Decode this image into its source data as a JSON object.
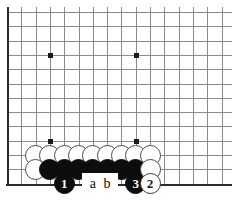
{
  "diagram": {
    "type": "go-board-problem",
    "board": {
      "columns": 15,
      "rows": 11,
      "cell_size": 14.3,
      "origin_x": 7,
      "origin_y": 12,
      "line_color": "#8b8b8b",
      "edge_color": "#2a2a2a",
      "background": "#ffffff",
      "left_edge_is_board_edge": true,
      "bottom_edge_is_board_edge": true,
      "top_edge_open": true,
      "right_edge_open": true
    },
    "star_points": [
      {
        "col": 3,
        "row": 3
      },
      {
        "col": 9,
        "row": 3
      },
      {
        "col": 3,
        "row": 9
      },
      {
        "col": 9,
        "row": 9
      }
    ],
    "stones": [
      {
        "col": 2,
        "row": 10,
        "color": "white"
      },
      {
        "col": 3,
        "row": 10,
        "color": "white"
      },
      {
        "col": 4,
        "row": 10,
        "color": "white"
      },
      {
        "col": 5,
        "row": 10,
        "color": "white"
      },
      {
        "col": 6,
        "row": 10,
        "color": "white"
      },
      {
        "col": 7,
        "row": 10,
        "color": "white"
      },
      {
        "col": 8,
        "row": 10,
        "color": "white"
      },
      {
        "col": 9,
        "row": 10,
        "color": "white"
      },
      {
        "col": 10,
        "row": 10,
        "color": "white"
      },
      {
        "col": 2,
        "row": 11,
        "color": "white"
      },
      {
        "col": 3,
        "row": 11,
        "color": "black"
      },
      {
        "col": 4,
        "row": 11,
        "color": "black"
      },
      {
        "col": 5,
        "row": 11,
        "color": "black"
      },
      {
        "col": 6,
        "row": 11,
        "color": "black"
      },
      {
        "col": 7,
        "row": 11,
        "color": "black"
      },
      {
        "col": 8,
        "row": 11,
        "color": "black"
      },
      {
        "col": 9,
        "row": 11,
        "color": "black"
      },
      {
        "col": 10,
        "row": 11,
        "color": "white"
      }
    ],
    "numbered_moves": [
      {
        "col": 4,
        "row": 12,
        "color": "black",
        "label": "1"
      },
      {
        "col": 9,
        "row": 12,
        "color": "black",
        "label": "3"
      },
      {
        "col": 10,
        "row": 12,
        "color": "white",
        "label": "2"
      }
    ],
    "letter_markers": [
      {
        "col": 6,
        "row": 12,
        "label": "a"
      },
      {
        "col": 7,
        "row": 12,
        "label": "b"
      }
    ]
  }
}
